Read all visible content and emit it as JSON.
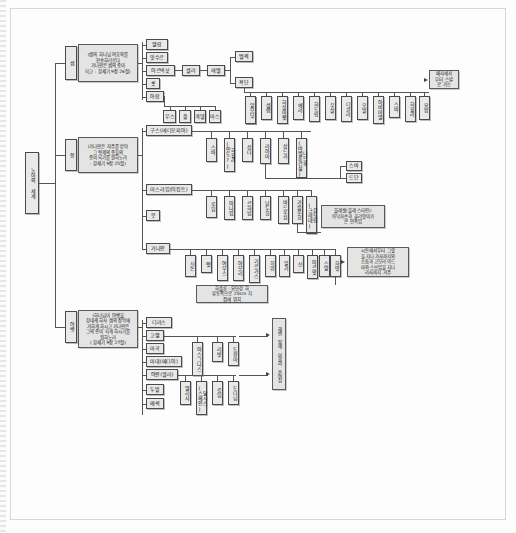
{
  "document": {
    "title": "노아의 세계",
    "kind": "genealogy-chart"
  },
  "root": {
    "label": "노아의 세계"
  },
  "branches": [
    {
      "id": "shem",
      "label": "셈",
      "note": "(셈의 하나님 여호와를\n찬송하리로다\n가나안은 셈의 종이\n되고 : 창세기 9장 26절)"
    },
    {
      "id": "ham",
      "label": "함",
      "note": "(가나안은 저주를 받아\n그 형제의 종들의\n종이 되기를 원하노라\n: 창세기 9장 25절)"
    },
    {
      "id": "japheth",
      "label": "야벳",
      "note": "(하나님이 야벳을\n창대케 하사 셈의 장막에\n거하게 하시고 가나안은\n그의 종이 되게 하시기를\n원하노라\n( 창세기 9장 27절)"
    }
  ],
  "shem": {
    "sons": [
      "엘람",
      "앗수르",
      "아르박삿",
      "룻",
      "아람"
    ],
    "aram_sons": [
      "우스",
      "훌",
      "게델",
      "마스"
    ],
    "arphaxad_line": [
      "셀라",
      "에벨"
    ],
    "eber_sons": [
      "벨렉",
      "욕단"
    ],
    "joktan_sons": [
      "알모닷",
      "셀렙",
      "하살마웻",
      "예라",
      "하도람",
      "우살",
      "디글라",
      "오발",
      "아비마엘",
      "스바",
      "하윌라",
      "요밥"
    ],
    "note": "메사에서\n부터 스발\n로 가는"
  },
  "ham": {
    "sons": [
      "구스(에디오피아)",
      "미스라임(이집트)",
      "붓",
      "가나안"
    ],
    "cush_sons": [
      "스바",
      "하윌라(인도?)",
      "삽다",
      "라아마",
      "삽드가",
      "니므롯(바벨론건설)"
    ],
    "raamah_sons": [
      "스바",
      "드단"
    ],
    "mizraim_sons": [
      "루딤",
      "아나밈",
      "르하빔",
      "납두힘",
      "바드루심",
      "가슬루힘",
      "갑도림(크레데)"
    ],
    "canaan_sons": [
      "시돈",
      "헷",
      "여부스",
      "아모리",
      "기르가스",
      "히위",
      "알가",
      "신",
      "아르왓",
      "스말",
      "하맛"
    ],
    "notes": {
      "philistine": "블레셋(블레 스타인):\n아낙자손과 골리앗이가\n큰 민족임",
      "canaan_border": "시돈에서부터 그랄\n을 지나 가사까지와\n소돔과 고모라 아드\n마와 스보임을 지나\n라사까지 거주",
      "hamath": "하솔론 : 요단강 하\n류동쪽으로 25km 지\n점에 위치"
    }
  },
  "japheth": {
    "sons": [
      "고멜",
      "마곡",
      "마대(메디아)",
      "야완(헬라)",
      "두발",
      "메섹",
      "디라스"
    ],
    "gomer_sons": [
      "아스그나스",
      "리밧",
      "도갈마"
    ],
    "javan_sons": [
      "엘리사",
      "달시스(스페인)",
      "깃딤",
      "도다님"
    ],
    "note": "해변 땅에 머물러 흩어짐"
  },
  "legend": {
    "box_fill": "#e9e9e9",
    "line_color": "#555555",
    "text_color": "#111111"
  }
}
